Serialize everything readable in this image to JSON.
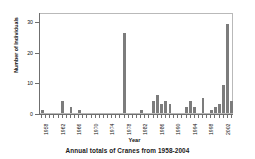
{
  "caption": "Annual totals of Cranes from 1958-2004",
  "axis": {
    "x_title": "Year",
    "y_title": "Number of Individuals"
  },
  "style": {
    "bar_color": "#7c7c7c",
    "frame_color": "#b9b9b9",
    "axis_color": "#6f6f6f",
    "text_color": "#111111",
    "background": "#ffffff"
  },
  "chart_data": {
    "type": "bar",
    "title": "Annual totals of Cranes from 1958-2004",
    "xlabel": "Year",
    "ylabel": "Number of Individuals",
    "ylim": [
      0,
      33
    ],
    "yticks": [
      0,
      10,
      20,
      30
    ],
    "ytick_labels": [
      "0",
      "10",
      "20",
      "30"
    ],
    "xtick_labels": [
      "1958",
      "1962",
      "1966",
      "1970",
      "1974",
      "1978",
      "1982",
      "1986",
      "1990",
      "1994",
      "1998",
      "2002"
    ],
    "grid": false,
    "legend": null,
    "categories": [
      "1958",
      "1959",
      "1960",
      "1961",
      "1962",
      "1963",
      "1964",
      "1965",
      "1966",
      "1967",
      "1968",
      "1969",
      "1970",
      "1971",
      "1972",
      "1973",
      "1974",
      "1975",
      "1976",
      "1977",
      "1978",
      "1979",
      "1980",
      "1981",
      "1982",
      "1983",
      "1984",
      "1985",
      "1986",
      "1987",
      "1988",
      "1989",
      "1990",
      "1991",
      "1992",
      "1993",
      "1994",
      "1995",
      "1996",
      "1997",
      "1998",
      "1999",
      "2000",
      "2001",
      "2002",
      "2003",
      "2004"
    ],
    "values": [
      1,
      0,
      0,
      0,
      0,
      4,
      0,
      2,
      0,
      1,
      0,
      0,
      0,
      0,
      0,
      0,
      0,
      0,
      0,
      0,
      26,
      0,
      0,
      0,
      1,
      0,
      0,
      4,
      6,
      3,
      4,
      3,
      0,
      0,
      0,
      2,
      4,
      2,
      0,
      5,
      0,
      1,
      2,
      3,
      9,
      29,
      4
    ]
  }
}
